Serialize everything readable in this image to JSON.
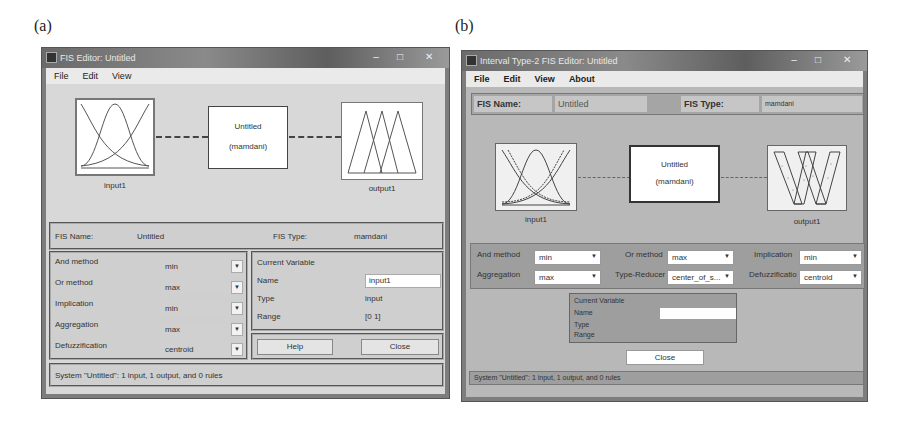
{
  "panels": [
    {
      "label": "(a)",
      "window": {
        "title": "FIS Editor: Untitled",
        "controls": {
          "minimize": "–",
          "maximize": "□",
          "close": "✕"
        },
        "menu": [
          "File",
          "Edit",
          "View"
        ]
      },
      "diagram": {
        "input": {
          "label": "input1",
          "icon": "gaussian-mf-icon"
        },
        "system": {
          "name": "Untitled",
          "type": "(mamdani)"
        },
        "output": {
          "label": "output1",
          "icon": "triangular-mf-icon"
        }
      },
      "fis_info": {
        "name_label": "FIS Name:",
        "name_value": "Untitled",
        "type_label": "FIS Type:",
        "type_value": "mamdani"
      },
      "methods": [
        {
          "label": "And method",
          "value": "min"
        },
        {
          "label": "Or method",
          "value": "max"
        },
        {
          "label": "Implication",
          "value": "min"
        },
        {
          "label": "Aggregation",
          "value": "max"
        },
        {
          "label": "Defuzzification",
          "value": "centroid"
        }
      ],
      "current_variable": {
        "title": "Current Variable",
        "name_label": "Name",
        "name_value": "input1",
        "type_label": "Type",
        "type_value": "input",
        "range_label": "Range",
        "range_value": "[0 1]"
      },
      "buttons": {
        "help": "Help",
        "close": "Close"
      },
      "status": "System \"Untitled\": 1 input, 1 output, and 0 rules"
    },
    {
      "label": "(b)",
      "window": {
        "title": "Interval Type-2 FIS Editor: Untitled",
        "controls": {
          "minimize": "–",
          "maximize": "□",
          "close": "✕"
        },
        "menu": [
          "File",
          "Edit",
          "View",
          "About"
        ]
      },
      "fis_info": {
        "name_label": "FIS Name:",
        "name_value": "Untitled",
        "type_label": "FIS Type:",
        "type_value": "mamdani"
      },
      "diagram": {
        "input": {
          "label": "input1",
          "icon": "interval-gaussian-mf-icon"
        },
        "system": {
          "name": "Untitled",
          "type": "(mamdani)"
        },
        "output": {
          "label": "output1",
          "icon": "interval-triangular-mf-icon"
        }
      },
      "methods": [
        {
          "label": "And method",
          "value": "min"
        },
        {
          "label": "Or method",
          "value": "max"
        },
        {
          "label": "Implication",
          "value": "min"
        },
        {
          "label": "Aggregation",
          "value": "max"
        },
        {
          "label": "Type-Reducer",
          "value": "center_of_s..."
        },
        {
          "label": "Defuzzificatio",
          "value": "centroid"
        }
      ],
      "current_variable": {
        "title": "Current Variable",
        "name_label": "Name",
        "name_value": "",
        "type_label": "Type",
        "range_label": "Range"
      },
      "buttons": {
        "close": "Close"
      },
      "status": "System \"Untitled\": 1 input, 1 output, and 0 rules"
    }
  ]
}
